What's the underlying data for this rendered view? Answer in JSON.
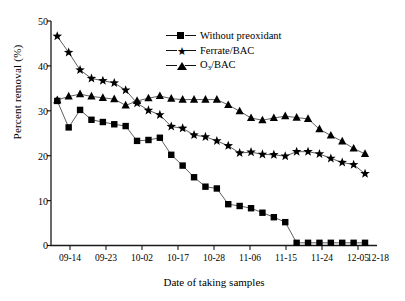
{
  "chart_data": {
    "type": "line",
    "title": "",
    "xlabel": "Date of taking samples",
    "ylabel": "Percent removal (%)",
    "ylim": [
      0,
      50
    ],
    "yticks": [
      0,
      10,
      20,
      30,
      40,
      50
    ],
    "xticks": [
      "09-14",
      "09-23",
      "10-02",
      "10-17",
      "10-28",
      "11-06",
      "11-15",
      "11-24",
      "12-05",
      "12-18"
    ],
    "grid": false,
    "legend_position": "top-center",
    "x": [
      "09-11",
      "09-14",
      "09-17",
      "09-20",
      "09-23",
      "09-26",
      "09-29",
      "10-02",
      "10-05",
      "10-08",
      "10-11",
      "10-17",
      "10-20",
      "10-23",
      "10-28",
      "10-31",
      "11-03",
      "11-06",
      "11-09",
      "11-12",
      "11-15",
      "11-19",
      "11-24",
      "11-27",
      "12-01",
      "12-05",
      "12-09",
      "12-13"
    ],
    "series": [
      {
        "name": "Without preoxidant",
        "marker": "square",
        "values": [
          32.2,
          26.3,
          30.2,
          28.0,
          27.5,
          27.0,
          26.6,
          23.3,
          23.5,
          24.0,
          20.2,
          17.8,
          15.2,
          13.1,
          12.7,
          9.2,
          8.8,
          8.3,
          7.3,
          6.3,
          5.2,
          0.6,
          0.6,
          0.6,
          0.6,
          0.6,
          0.6,
          0.6
        ]
      },
      {
        "name": "Ferrate/BAC",
        "marker": "star",
        "values": [
          46.6,
          43.0,
          39.1,
          37.2,
          36.7,
          36.2,
          34.6,
          31.7,
          30.1,
          29.1,
          26.5,
          26.1,
          24.6,
          24.2,
          23.3,
          22.2,
          20.6,
          20.8,
          20.3,
          20.2,
          19.9,
          20.9,
          20.9,
          20.4,
          19.4,
          18.5,
          18.0,
          16.0
        ]
      },
      {
        "name": "O3/BAC",
        "marker": "triangle",
        "values": [
          32.4,
          33.2,
          33.7,
          33.2,
          32.9,
          32.6,
          31.2,
          32.2,
          32.8,
          33.3,
          32.7,
          32.5,
          32.5,
          32.5,
          32.5,
          31.3,
          29.9,
          28.4,
          27.9,
          28.4,
          28.8,
          28.5,
          28.2,
          25.9,
          24.5,
          23.2,
          21.6,
          20.4
        ]
      }
    ]
  },
  "legend": {
    "items": [
      {
        "label": "Without preoxidant",
        "marker": "square"
      },
      {
        "label": "Ferrate/BAC",
        "marker": "star"
      },
      {
        "label": "O",
        "sub": "3",
        "label_tail": "/BAC",
        "marker": "triangle"
      }
    ]
  },
  "axis": {
    "y_title": "Percent removal (%)",
    "x_title": "Date of taking samples",
    "y_tick_labels": [
      "50",
      "40",
      "30",
      "20",
      "10",
      "0"
    ],
    "x_tick_labels": [
      "09-14",
      "09-23",
      "10-02",
      "10-17",
      "10-28",
      "11-06",
      "11-15",
      "11-24",
      "12-05",
      "12-18"
    ]
  }
}
